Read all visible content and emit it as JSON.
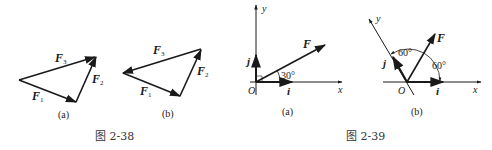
{
  "figures": [
    {
      "id": "2-38",
      "caption": "图 2-38",
      "subfigures": [
        {
          "label": "(a)",
          "vectors": [
            {
              "name": "F",
              "sub": "1"
            },
            {
              "name": "F",
              "sub": "2"
            },
            {
              "name": "F",
              "sub": "3"
            }
          ]
        },
        {
          "label": "(b)",
          "vectors": [
            {
              "name": "F",
              "sub": "1"
            },
            {
              "name": "F",
              "sub": "2"
            },
            {
              "name": "F",
              "sub": "3"
            }
          ]
        }
      ]
    },
    {
      "id": "2-39",
      "caption": "图 2-39",
      "subfigures": [
        {
          "label": "(a)",
          "axis_x": "x",
          "axis_y": "y",
          "origin": "O",
          "unit_i": "i",
          "unit_j": "j",
          "force": "F",
          "angle": "30°"
        },
        {
          "label": "(b)",
          "axis_x": "x",
          "axis_y": "y",
          "origin": "O",
          "unit_i": "i",
          "unit_j": "j",
          "force": "F",
          "angle1": "60°",
          "angle2": "60°"
        }
      ]
    }
  ]
}
